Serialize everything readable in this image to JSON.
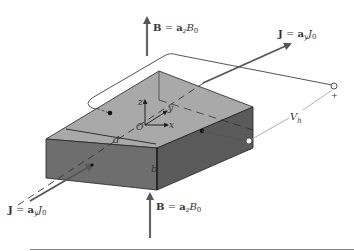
{
  "figure": {
    "b_top": {
      "bold": "B",
      "eq": " = ",
      "unit": "a",
      "sub": "z",
      "sym": "B",
      "symsub": "0"
    },
    "b_bottom": {
      "bold": "B",
      "eq": " = ",
      "unit": "a",
      "sub": "z",
      "sym": "B",
      "symsub": "0"
    },
    "j_top": {
      "bold": "J",
      "eq": " = ",
      "unit": "a",
      "sub": "y",
      "sym": "J",
      "symsub": "0"
    },
    "j_bottom": {
      "bold": "J",
      "eq": " = ",
      "unit": "a",
      "sub": "y",
      "sym": "J",
      "symsub": "0"
    },
    "axes": {
      "z": "z",
      "y": "y",
      "x": "x",
      "origin": "O"
    },
    "dims": {
      "width": "d",
      "height": "b"
    },
    "voltage": {
      "sym": "V",
      "sub": "h",
      "plus": "+",
      "minus": "−"
    }
  },
  "colors": {
    "top_face": "#a9a9a9",
    "front_face": "#6e6e6e",
    "side_face": "#5a5a5a",
    "arrow": "#666666",
    "wire": "#555555"
  }
}
